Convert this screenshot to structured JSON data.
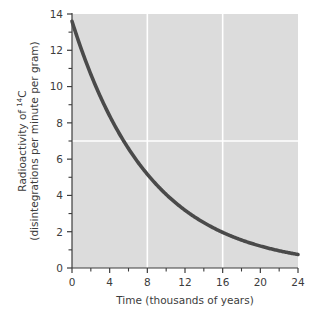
{
  "chart_data": {
    "type": "line",
    "title": "",
    "xlabel": "Time (thousands of years)",
    "ylabel_line1_prefix": "Radioactivity of ",
    "ylabel_line1_isotope_mass": "14",
    "ylabel_line1_isotope_symbol": "C",
    "ylabel_line2": "(disintegrations per minute per gram)",
    "xlim": [
      0,
      24
    ],
    "ylim": [
      0,
      14
    ],
    "x_major_ticks": [
      0,
      4,
      8,
      12,
      16,
      20,
      24
    ],
    "x_minor_ticks": [
      2,
      6,
      10,
      14,
      18,
      22
    ],
    "x_tick_labels": [
      "0",
      "4",
      "8",
      "12",
      "16",
      "20",
      "24"
    ],
    "y_major_ticks": [
      0,
      2,
      4,
      6,
      8,
      10,
      12,
      14
    ],
    "y_minor_ticks": [
      1,
      3,
      5,
      7,
      9,
      11,
      13
    ],
    "y_tick_labels": [
      "0",
      "2",
      "4",
      "6",
      "8",
      "10",
      "12",
      "14"
    ],
    "grid": true,
    "gridlines_vertical": [
      8,
      16
    ],
    "gridlines_horizontal": [
      7
    ],
    "legend": "none",
    "plot_background_color": "#dcdcdc",
    "gridline_color": "#ffffff",
    "curve_color": "#4a4a4a",
    "axis_color": "#3c3c3c",
    "series": [
      {
        "name": "Carbon-14 decay",
        "half_life_thousand_years": 5.73,
        "initial_value": 13.6,
        "x": [
          0,
          1,
          2,
          3,
          4,
          5,
          6,
          7,
          8,
          9,
          10,
          11,
          12,
          13,
          14,
          15,
          16,
          17,
          18,
          19,
          20,
          21,
          22,
          23,
          24
        ],
        "values": [
          13.6,
          12.07,
          10.71,
          9.5,
          8.43,
          7.48,
          6.64,
          5.89,
          5.23,
          4.64,
          4.12,
          3.65,
          3.24,
          2.88,
          2.55,
          2.27,
          2.01,
          1.78,
          1.58,
          1.4,
          1.25,
          1.11,
          0.98,
          0.87,
          0.77
        ]
      }
    ]
  }
}
